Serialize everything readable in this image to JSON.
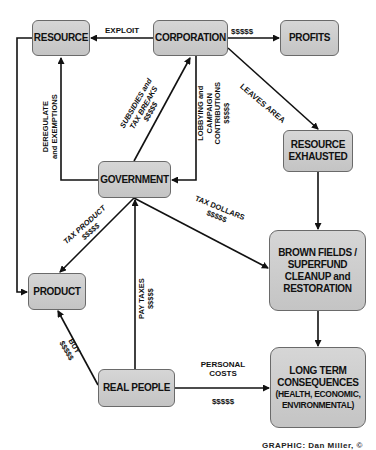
{
  "nodes": {
    "resource": "RESOURCE",
    "corporation": "CORPORATION",
    "profits": "PROFITS",
    "resource_exhausted": [
      "RESOURCE",
      "EXHAUSTED"
    ],
    "government": "GOVERNMENT",
    "brownfields": [
      "BROWN FIELDS /",
      "SUPERFUND",
      "CLEANUP and",
      "RESTORATION"
    ],
    "product": "PRODUCT",
    "real_people": "REAL PEOPLE",
    "long_term": [
      "LONG TERM",
      "CONSEQUENCES",
      "(HEALTH, ECONOMIC,",
      "ENVIRONMENTAL)"
    ]
  },
  "edges": {
    "exploit": "EXPLOIT",
    "profits_money": "$$$$$",
    "leaves_area": "LEAVES AREA",
    "deregulate": [
      "DEREGULATE",
      "and EXEMPTIONS"
    ],
    "subsidies": [
      "SUBSIDIES and",
      "TAX BREAKS",
      "$$$$$"
    ],
    "lobbying": [
      "LOBBYING and",
      "CAMPAIGN",
      "CONTRIBUTIONS",
      "$$$$$"
    ],
    "tax_product": [
      "TAX PRODUCT",
      "$$$$$"
    ],
    "tax_dollars": [
      "TAX DOLLARS",
      "$$$$$"
    ],
    "pay_taxes": [
      "PAY TAXES",
      "$$$$$"
    ],
    "buy": [
      "BUY",
      "$$$$$"
    ],
    "personal_costs": [
      "PERSONAL",
      "COSTS",
      "$$$$$"
    ]
  },
  "credit": "GRAPHIC: Dan Miller, ©"
}
